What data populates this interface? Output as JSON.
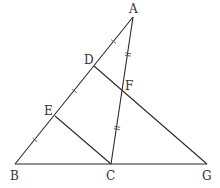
{
  "diagram": {
    "type": "geometry",
    "stroke_color": "#2a2a2a",
    "points": {
      "A": {
        "x": 133,
        "y": 17,
        "label": "A",
        "lx": 129,
        "ly": 13
      },
      "B": {
        "x": 15,
        "y": 164,
        "label": "B",
        "lx": 10,
        "ly": 180
      },
      "C": {
        "x": 111,
        "y": 164,
        "label": "C",
        "lx": 106,
        "ly": 180
      },
      "G": {
        "x": 207,
        "y": 164,
        "label": "G",
        "lx": 202,
        "ly": 180
      },
      "D": {
        "x": 94,
        "y": 66,
        "label": "D",
        "lx": 84,
        "ly": 64
      },
      "E": {
        "x": 55,
        "y": 116,
        "label": "E",
        "lx": 44,
        "ly": 115
      },
      "F": {
        "x": 123,
        "y": 92,
        "label": "F",
        "lx": 125,
        "ly": 90
      }
    },
    "segments": [
      [
        "A",
        "B"
      ],
      [
        "B",
        "G"
      ],
      [
        "A",
        "C"
      ],
      [
        "D",
        "G"
      ],
      [
        "E",
        "C"
      ]
    ],
    "tick_marks": [
      {
        "segment": "A-D",
        "count": 1
      },
      {
        "segment": "D-E",
        "count": 1
      },
      {
        "segment": "E-B",
        "count": 1
      },
      {
        "segment": "A-F",
        "count": 2
      },
      {
        "segment": "F-C",
        "count": 2
      }
    ]
  }
}
